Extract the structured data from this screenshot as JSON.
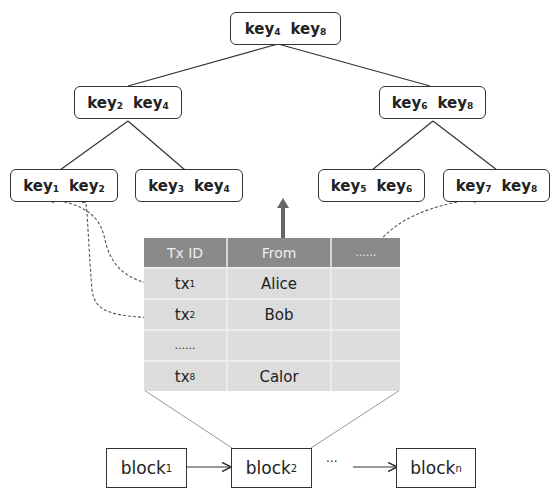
{
  "tree": {
    "root": {
      "k1": "key",
      "s1": "4",
      "k2": "key",
      "s2": "8"
    },
    "left": {
      "k1": "key",
      "s1": "2",
      "k2": "key",
      "s2": "4"
    },
    "right": {
      "k1": "key",
      "s1": "6",
      "k2": "key",
      "s2": "8"
    },
    "leaves": [
      {
        "k1": "key",
        "s1": "1",
        "k2": "key",
        "s2": "2"
      },
      {
        "k1": "key",
        "s1": "3",
        "k2": "key",
        "s2": "4"
      },
      {
        "k1": "key",
        "s1": "5",
        "k2": "key",
        "s2": "6"
      },
      {
        "k1": "key",
        "s1": "7",
        "k2": "key",
        "s2": "8"
      }
    ]
  },
  "table": {
    "headers": [
      "Tx ID",
      "From",
      "......"
    ],
    "rows": [
      {
        "id": "tx",
        "sub": "1",
        "from": "Alice"
      },
      {
        "id": "tx",
        "sub": "2",
        "from": "Bob"
      },
      {
        "id": "......",
        "sub": "",
        "from": ""
      },
      {
        "id": "tx",
        "sub": "8",
        "from": "Calor"
      }
    ]
  },
  "chain": {
    "blocks": [
      {
        "label": "block",
        "sub": "1"
      },
      {
        "label": "block",
        "sub": "2"
      },
      {
        "label": "block",
        "sub": "n"
      }
    ],
    "ellipsis": "···"
  },
  "colors": {
    "header_bg": "#8a8a8a",
    "row_bg": "#dcdcdc",
    "stroke": "#333333"
  }
}
